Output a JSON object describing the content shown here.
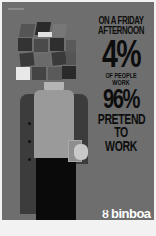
{
  "poster": {
    "headline": {
      "line1": "ON A FRIDAY",
      "line2": "AFTERNOON",
      "stat1": "4%",
      "line3": "OF PEOPLE WORK",
      "stat2": "96%",
      "line4": "PRETEND",
      "line5": "TO WORK"
    },
    "brand": {
      "mark": "ȣ",
      "name": "binboa",
      "tagline": "One night in town · vodka"
    },
    "colors": {
      "background": "#6e6e6e",
      "text": "#0d0d0d",
      "logo": "#ffffff"
    }
  }
}
